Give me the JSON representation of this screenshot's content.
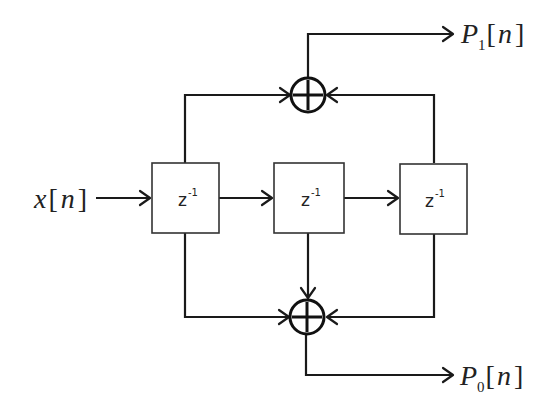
{
  "diagram": {
    "title": "",
    "input": {
      "symbol": "x",
      "index": "n",
      "label": "x[n]"
    },
    "delays": [
      {
        "id": "delay-1",
        "label": "z",
        "exponent": "-1"
      },
      {
        "id": "delay-2",
        "label": "z",
        "exponent": "-1"
      },
      {
        "id": "delay-3",
        "label": "z",
        "exponent": "-1"
      }
    ],
    "adders": [
      {
        "id": "adder-top",
        "symbol": "+",
        "inputs": [
          "delay-1 output",
          "delay-3 output"
        ],
        "output": "P1[n]"
      },
      {
        "id": "adder-bottom",
        "symbol": "+",
        "inputs": [
          "delay-1 output",
          "delay-2 output",
          "delay-3 output"
        ],
        "output": "P0[n]"
      }
    ],
    "outputs": [
      {
        "id": "out-p1",
        "symbol": "P",
        "subscript": "1",
        "index": "n",
        "label": "P1[n]"
      },
      {
        "id": "out-p0",
        "symbol": "P",
        "subscript": "0",
        "index": "n",
        "label": "P0[n]"
      }
    ],
    "colors": {
      "line": "#1a1a1a",
      "box_border": "#333333",
      "background": "#ffffff"
    }
  }
}
